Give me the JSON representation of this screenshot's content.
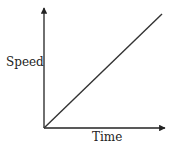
{
  "chart_data": {
    "type": "line",
    "title": "",
    "xlabel": "Time",
    "ylabel": "Speed",
    "x": [
      0,
      1
    ],
    "series": [
      {
        "name": "Speed",
        "values": [
          0,
          1
        ]
      }
    ],
    "xlim": [
      0,
      1
    ],
    "ylim": [
      0,
      1
    ],
    "grid": false,
    "legend": null,
    "axis_arrows": true,
    "tick_labels": false,
    "colors": {
      "line": "#333333",
      "axes": "#222222"
    }
  }
}
